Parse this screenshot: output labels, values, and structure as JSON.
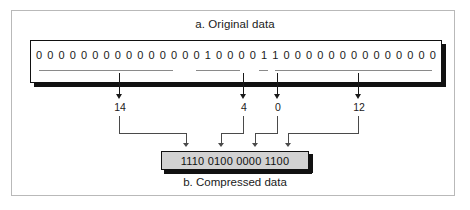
{
  "figure": {
    "caption_a": "a. Original data",
    "caption_b": "b. Compressed data"
  },
  "original_data": {
    "bits": [
      "0",
      "0",
      "0",
      "0",
      "0",
      "0",
      "0",
      "0",
      "0",
      "0",
      "0",
      "0",
      "0",
      "0",
      "0",
      "1",
      "0",
      "0",
      "0",
      "0",
      "1",
      "1",
      "0",
      "0",
      "0",
      "0",
      "0",
      "0",
      "0",
      "0",
      "0",
      "0",
      "0",
      "0",
      "0",
      "0"
    ],
    "bit_string": "000000000000000100001100000000000000",
    "total_bits": 36
  },
  "run_groups": [
    {
      "name": "group-1",
      "zero_count_label": "14",
      "start_index": 0,
      "end_index": 14
    },
    {
      "name": "group-2",
      "zero_count_label": "4",
      "start_index": 16,
      "end_index": 20
    },
    {
      "name": "group-3",
      "zero_count_label": "0",
      "start_index": 21,
      "end_index": 21
    },
    {
      "name": "group-4",
      "zero_count_label": "12",
      "start_index": 22,
      "end_index": 35
    }
  ],
  "compressed_data": {
    "text": "1110 0100 0000 1100",
    "nibbles": [
      "1110",
      "0100",
      "0000",
      "1100"
    ]
  },
  "colors": {
    "frame": "#b9b9b9",
    "box_border": "#111111",
    "compressed_fill": "#d2d2d2",
    "underline": "#8a8a8a",
    "arrow": "#1a1a1a",
    "connector": "#4a4a4a",
    "text": "#1a1a1a",
    "background": "#ffffff"
  }
}
